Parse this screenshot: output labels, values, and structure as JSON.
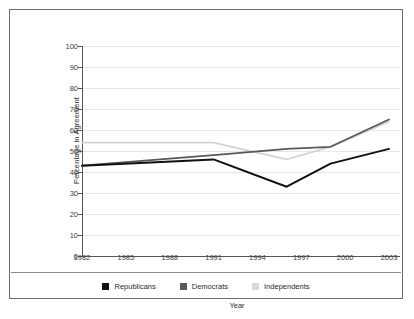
{
  "chart_data": {
    "type": "line",
    "title": "",
    "xlabel": "Year",
    "ylabel": "Percentage in Agreement",
    "xlim": [
      1982,
      2003
    ],
    "ylim": [
      0,
      100
    ],
    "ytick_step": 10,
    "grid": true,
    "legend_position": "bottom",
    "xticks": [
      "1982",
      "1985",
      "1988",
      "1991",
      "1994",
      "1997",
      "2000",
      "2003"
    ],
    "yticks": [
      "0",
      "10",
      "20",
      "30",
      "40",
      "50",
      "60",
      "70",
      "80",
      "90",
      "100"
    ],
    "x": [
      1982,
      1991,
      1996,
      1999,
      2003
    ],
    "series": [
      {
        "name": "Republicans",
        "color": "#111111",
        "values": [
          43,
          46,
          33,
          44,
          51
        ]
      },
      {
        "name": "Democrats",
        "color": "#595959",
        "values": [
          43,
          48,
          51,
          52,
          65
        ]
      },
      {
        "name": "Independents",
        "color": "#d4d4d4",
        "values": [
          54,
          54,
          46,
          52,
          64
        ]
      }
    ]
  },
  "legend": {
    "items": [
      {
        "label": "Republicans",
        "color": "#111111"
      },
      {
        "label": "Democrats",
        "color": "#595959"
      },
      {
        "label": "Independents",
        "color": "#d9d9d9"
      }
    ]
  }
}
